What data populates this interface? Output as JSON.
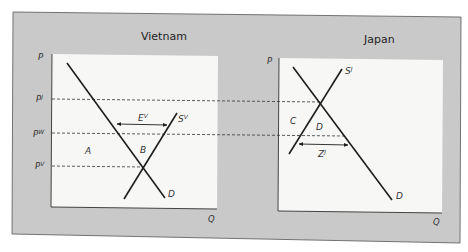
{
  "heading_fragment": "Market",
  "panels": {
    "vietnam": {
      "title": "Vietnam",
      "y_axis": "P",
      "x_axis": "Q",
      "price_levels": [
        {
          "name": "P",
          "sup": "J"
        },
        {
          "name": "P",
          "sup": "W"
        },
        {
          "name": "P",
          "sup": "V"
        }
      ],
      "curves": {
        "demand": "D",
        "supply": {
          "name": "S",
          "sup": "V"
        }
      },
      "arrow": {
        "name": "E",
        "sup": "V"
      },
      "regions": [
        "A",
        "B"
      ]
    },
    "japan": {
      "title": "Japan",
      "y_axis": "P",
      "x_axis": "Q",
      "curves": {
        "demand": "D",
        "supply": {
          "name": "S",
          "sup": "J"
        }
      },
      "arrow": {
        "name": "Z",
        "sup": "J"
      },
      "regions": [
        "C",
        "D"
      ]
    }
  },
  "colors": {
    "frame": "#c9c9c9",
    "plot_bg": "#f7f7f5",
    "line": "#1e1e1e"
  }
}
